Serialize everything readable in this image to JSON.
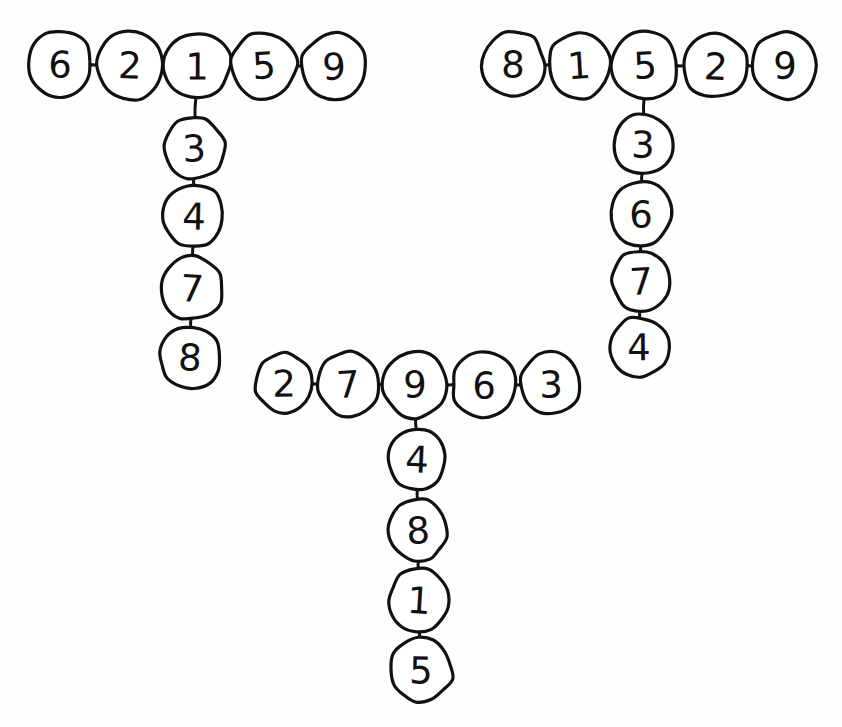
{
  "page": {
    "background_color": "#fefefe",
    "ink_color": "#111111",
    "width": 842,
    "height": 727,
    "style": "hand-drawn node-and-link diagram"
  },
  "graphs": [
    {
      "id": "left-tree",
      "name": "left-tree",
      "shape": "T-shaped tree",
      "junction_value": "1",
      "horizontal_row": [
        "6",
        "2",
        "1",
        "5",
        "9"
      ],
      "vertical_chain": [
        "3",
        "4",
        "7",
        "8"
      ],
      "nodes": [
        {
          "value": "6",
          "cx": 60,
          "cy": 64,
          "rx": 32,
          "ry": 33
        },
        {
          "value": "2",
          "cx": 130,
          "cy": 65,
          "rx": 33,
          "ry": 34
        },
        {
          "value": "1",
          "cx": 197,
          "cy": 66,
          "rx": 33,
          "ry": 33
        },
        {
          "value": "5",
          "cx": 264,
          "cy": 65,
          "rx": 33,
          "ry": 33
        },
        {
          "value": "9",
          "cx": 334,
          "cy": 66,
          "rx": 32,
          "ry": 33
        },
        {
          "value": "3",
          "cx": 194,
          "cy": 148,
          "rx": 30,
          "ry": 30
        },
        {
          "value": "4",
          "cx": 194,
          "cy": 216,
          "rx": 30,
          "ry": 31
        },
        {
          "value": "7",
          "cx": 192,
          "cy": 288,
          "rx": 31,
          "ry": 32
        },
        {
          "value": "8",
          "cx": 190,
          "cy": 357,
          "rx": 30,
          "ry": 31
        }
      ],
      "edges": [
        {
          "from": "6",
          "to": "2"
        },
        {
          "from": "2",
          "to": "1"
        },
        {
          "from": "1",
          "to": "5"
        },
        {
          "from": "5",
          "to": "9"
        },
        {
          "from": "1",
          "to": "3"
        },
        {
          "from": "3",
          "to": "4"
        },
        {
          "from": "4",
          "to": "7"
        },
        {
          "from": "7",
          "to": "8"
        }
      ]
    },
    {
      "id": "right-tree",
      "name": "right-tree",
      "shape": "T-shaped tree",
      "junction_value": "5",
      "horizontal_row": [
        "8",
        "1",
        "5",
        "2",
        "9"
      ],
      "vertical_chain": [
        "3",
        "6",
        "7",
        "4"
      ],
      "nodes": [
        {
          "value": "8",
          "cx": 513,
          "cy": 64,
          "rx": 32,
          "ry": 33
        },
        {
          "value": "1",
          "cx": 579,
          "cy": 65,
          "rx": 31,
          "ry": 33
        },
        {
          "value": "5",
          "cx": 645,
          "cy": 65,
          "rx": 33,
          "ry": 34
        },
        {
          "value": "2",
          "cx": 716,
          "cy": 66,
          "rx": 33,
          "ry": 32
        },
        {
          "value": "9",
          "cx": 785,
          "cy": 65,
          "rx": 32,
          "ry": 33
        },
        {
          "value": "3",
          "cx": 643,
          "cy": 144,
          "rx": 29,
          "ry": 30
        },
        {
          "value": "6",
          "cx": 641,
          "cy": 214,
          "rx": 30,
          "ry": 32
        },
        {
          "value": "7",
          "cx": 641,
          "cy": 281,
          "rx": 29,
          "ry": 30
        },
        {
          "value": "4",
          "cx": 639,
          "cy": 347,
          "rx": 29,
          "ry": 30
        }
      ],
      "edges": [
        {
          "from": "8",
          "to": "1"
        },
        {
          "from": "1",
          "to": "5"
        },
        {
          "from": "5",
          "to": "2"
        },
        {
          "from": "2",
          "to": "9"
        },
        {
          "from": "5",
          "to": "3"
        },
        {
          "from": "3",
          "to": "6"
        },
        {
          "from": "6",
          "to": "7"
        },
        {
          "from": "7",
          "to": "4"
        }
      ]
    },
    {
      "id": "bottom-tree",
      "name": "bottom-tree",
      "shape": "T-shaped tree",
      "junction_value": "9",
      "horizontal_row": [
        "2",
        "7",
        "9",
        "6",
        "3"
      ],
      "vertical_chain": [
        "4",
        "8",
        "1",
        "5"
      ],
      "nodes": [
        {
          "value": "2",
          "cx": 284,
          "cy": 383,
          "rx": 28,
          "ry": 30
        },
        {
          "value": "7",
          "cx": 348,
          "cy": 384,
          "rx": 30,
          "ry": 32
        },
        {
          "value": "9",
          "cx": 415,
          "cy": 384,
          "rx": 32,
          "ry": 34
        },
        {
          "value": "6",
          "cx": 484,
          "cy": 385,
          "rx": 32,
          "ry": 33
        },
        {
          "value": "3",
          "cx": 551,
          "cy": 384,
          "rx": 30,
          "ry": 31
        },
        {
          "value": "4",
          "cx": 417,
          "cy": 459,
          "rx": 29,
          "ry": 31
        },
        {
          "value": "8",
          "cx": 418,
          "cy": 530,
          "rx": 29,
          "ry": 31
        },
        {
          "value": "1",
          "cx": 419,
          "cy": 600,
          "rx": 30,
          "ry": 31
        },
        {
          "value": "5",
          "cx": 421,
          "cy": 670,
          "rx": 31,
          "ry": 32
        }
      ],
      "edges": [
        {
          "from": "2",
          "to": "7"
        },
        {
          "from": "7",
          "to": "9"
        },
        {
          "from": "9",
          "to": "6"
        },
        {
          "from": "6",
          "to": "3"
        },
        {
          "from": "9",
          "to": "4"
        },
        {
          "from": "4",
          "to": "8"
        },
        {
          "from": "8",
          "to": "1"
        },
        {
          "from": "1",
          "to": "5"
        }
      ]
    }
  ]
}
